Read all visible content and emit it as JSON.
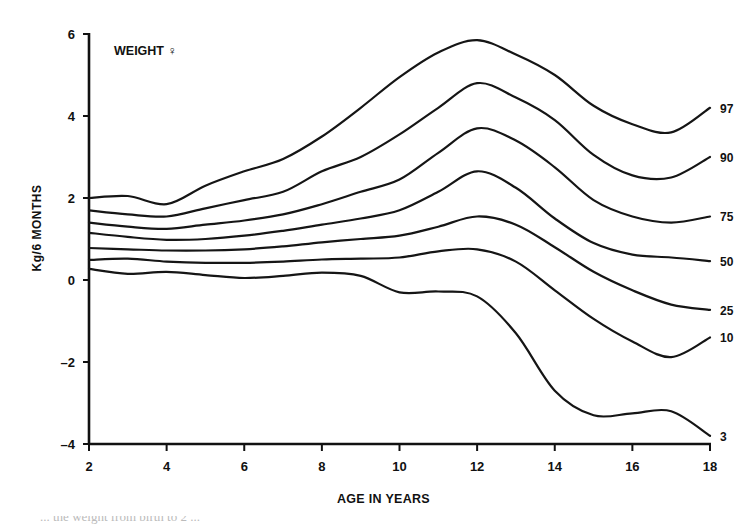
{
  "chart_data": {
    "type": "line",
    "title": "WEIGHT ♀",
    "xlabel": "AGE IN YEARS",
    "ylabel": "Kg/6 MONTHS",
    "xlim": [
      2,
      18
    ],
    "ylim": [
      -4,
      6
    ],
    "xticks": [
      2,
      4,
      6,
      8,
      10,
      12,
      14,
      16,
      18
    ],
    "yticks": [
      6,
      4,
      2,
      0,
      -2,
      -4
    ],
    "grid": false,
    "legend": "inline labels at right end of each curve",
    "x": [
      2,
      3,
      4,
      5,
      6,
      7,
      8,
      9,
      10,
      11,
      12,
      13,
      14,
      15,
      16,
      17,
      18
    ],
    "series": [
      {
        "name": "97",
        "values": [
          2.0,
          2.05,
          1.85,
          2.3,
          2.65,
          2.95,
          3.5,
          4.2,
          4.95,
          5.55,
          5.85,
          5.5,
          5.0,
          4.25,
          3.8,
          3.6,
          4.2
        ]
      },
      {
        "name": "90",
        "values": [
          1.7,
          1.6,
          1.55,
          1.75,
          1.95,
          2.15,
          2.65,
          3.0,
          3.55,
          4.2,
          4.8,
          4.45,
          3.9,
          3.05,
          2.55,
          2.5,
          3.0
        ]
      },
      {
        "name": "75",
        "values": [
          1.4,
          1.3,
          1.25,
          1.35,
          1.45,
          1.6,
          1.85,
          2.15,
          2.45,
          3.1,
          3.7,
          3.4,
          2.75,
          1.95,
          1.55,
          1.4,
          1.55
        ]
      },
      {
        "name": "50",
        "values": [
          1.15,
          1.05,
          0.98,
          1.0,
          1.08,
          1.2,
          1.35,
          1.5,
          1.7,
          2.15,
          2.65,
          2.25,
          1.5,
          0.9,
          0.62,
          0.55,
          0.46
        ]
      },
      {
        "name": "25",
        "values": [
          0.78,
          0.75,
          0.72,
          0.72,
          0.75,
          0.82,
          0.92,
          1.0,
          1.08,
          1.3,
          1.55,
          1.35,
          0.8,
          0.2,
          -0.25,
          -0.6,
          -0.73
        ]
      },
      {
        "name": "10",
        "values": [
          0.49,
          0.52,
          0.45,
          0.42,
          0.42,
          0.45,
          0.5,
          0.52,
          0.55,
          0.7,
          0.75,
          0.45,
          -0.25,
          -0.95,
          -1.5,
          -1.88,
          -1.4
        ]
      },
      {
        "name": "3",
        "values": [
          0.27,
          0.15,
          0.2,
          0.12,
          0.05,
          0.1,
          0.18,
          0.1,
          -0.3,
          -0.28,
          -0.4,
          -1.3,
          -2.7,
          -3.3,
          -3.25,
          -3.2,
          -3.8
        ]
      }
    ]
  },
  "caption": {
    "partial_text": "... the weight from birth to 2 ..."
  },
  "colors": {
    "line": "#151515",
    "background": "#ffffff"
  }
}
